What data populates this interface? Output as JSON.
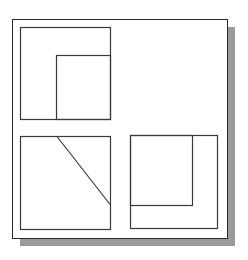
{
  "figure": {
    "frame": {
      "x": 12,
      "y": 19,
      "w": 215,
      "h": 219,
      "border": "#2a2a2a",
      "background": "#ffffff"
    },
    "shadow": {
      "offset_x": 8,
      "offset_y": 8,
      "color": "#9a9a9a"
    },
    "line_color": "#3a3a3a",
    "panels": [
      {
        "name": "top-left",
        "outer": {
          "x": 20,
          "y": 27,
          "w": 90,
          "h": 92
        },
        "inner_rect": {
          "x": 56,
          "y": 55,
          "w": 54,
          "h": 64
        }
      },
      {
        "name": "bottom-left",
        "outer": {
          "x": 20,
          "y": 136,
          "w": 90,
          "h": 93
        },
        "diagonal": {
          "x1": 57,
          "y1": 136,
          "x2": 110,
          "y2": 205
        }
      },
      {
        "name": "bottom-right",
        "outer": {
          "x": 130,
          "y": 135,
          "w": 87,
          "h": 93
        },
        "inner_rect": {
          "x": 130,
          "y": 135,
          "w": 62,
          "h": 70
        }
      }
    ]
  }
}
